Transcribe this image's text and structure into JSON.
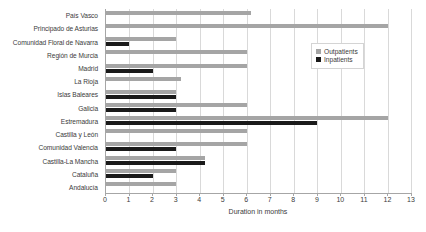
{
  "chart_data": {
    "type": "bar",
    "orientation": "horizontal",
    "title": "",
    "xlabel": "Duration in months",
    "ylabel": "",
    "xlim": [
      0,
      13
    ],
    "xticks": [
      0,
      1,
      2,
      3,
      4,
      5,
      6,
      7,
      8,
      9,
      10,
      11,
      12,
      13
    ],
    "grid": true,
    "legend_position": "top-right",
    "categories": [
      "País Vasco",
      "Principado de Asturias",
      "Comunidad Floral de Navarra",
      "Región de Murcia",
      "Madrid",
      "La Rioja",
      "Islas Baleares",
      "Galicia",
      "Estremadura",
      "Castilla y León",
      "Comunidad Valencia",
      "Castilla-La Mancha",
      "Cataluña",
      "Andalucía"
    ],
    "series": [
      {
        "name": "Outpatients",
        "color": "#a5a5a5",
        "values": [
          6.2,
          12.0,
          3.0,
          6.0,
          6.0,
          3.2,
          3.0,
          6.0,
          12.0,
          6.0,
          6.0,
          4.2,
          3.0,
          3.0
        ]
      },
      {
        "name": "Inpatients",
        "color": "#1a1a1a",
        "values": [
          0,
          0,
          1.0,
          0,
          2.0,
          0,
          3.0,
          3.0,
          9.0,
          0,
          3.0,
          4.2,
          2.0,
          0
        ]
      }
    ]
  },
  "legend": {
    "items": [
      {
        "label": "Outpatients"
      },
      {
        "label": "Inpatients"
      }
    ]
  },
  "colors": {
    "outpatients": "#a5a5a5",
    "inpatients": "#1a1a1a",
    "gridline": "#d9d9d9",
    "axis": "#a6a6a6",
    "text": "#3b3b3b"
  }
}
